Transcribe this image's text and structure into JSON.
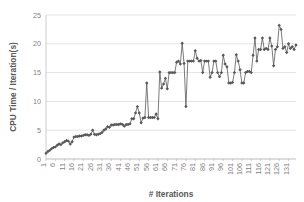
{
  "chart_data": {
    "type": "line",
    "title": "",
    "xlabel": "# Iterations",
    "ylabel": "CPU Time / Iteration(s)",
    "xlim": [
      1,
      135
    ],
    "ylim": [
      0,
      25
    ],
    "ytick_values": [
      0,
      5,
      10,
      15,
      20,
      25
    ],
    "ytick_labels": [
      "0",
      "5",
      "10",
      "15",
      "20",
      "25"
    ],
    "xtick_values": [
      1,
      6,
      11,
      16,
      21,
      26,
      31,
      36,
      41,
      46,
      51,
      56,
      61,
      66,
      71,
      76,
      81,
      86,
      91,
      96,
      101,
      106,
      111,
      116,
      121,
      126,
      131
    ],
    "xtick_labels": [
      "1",
      "6",
      "11",
      "16",
      "21",
      "26",
      "31",
      "36",
      "41",
      "46",
      "51",
      "56",
      "61",
      "66",
      "71",
      "76",
      "81",
      "86",
      "91",
      "96",
      "101",
      "106",
      "111",
      "116",
      "121",
      "126",
      "131"
    ],
    "grid": true,
    "grid_axis": "y",
    "legend": false,
    "marker": "diamond",
    "series_color": "#595959",
    "grid_color": "#D9D9D9",
    "background": "#FFFFFF",
    "x": [
      1,
      2,
      3,
      4,
      5,
      6,
      7,
      8,
      9,
      10,
      11,
      12,
      13,
      14,
      15,
      16,
      17,
      18,
      19,
      20,
      21,
      22,
      23,
      24,
      25,
      26,
      27,
      28,
      29,
      30,
      31,
      32,
      33,
      34,
      35,
      36,
      37,
      38,
      39,
      40,
      41,
      42,
      43,
      44,
      45,
      46,
      47,
      48,
      49,
      50,
      51,
      52,
      53,
      54,
      55,
      56,
      57,
      58,
      59,
      60,
      61,
      62,
      63,
      64,
      65,
      66,
      67,
      68,
      69,
      70,
      71,
      72,
      73,
      74,
      75,
      76,
      77,
      78,
      79,
      80,
      81,
      82,
      83,
      84,
      85,
      86,
      87,
      88,
      89,
      90,
      91,
      92,
      93,
      94,
      95,
      96,
      97,
      98,
      99,
      100,
      101,
      102,
      103,
      104,
      105,
      106,
      107,
      108,
      109,
      110,
      111,
      112,
      113,
      114,
      115,
      116,
      117,
      118,
      119,
      120,
      121,
      122,
      123,
      124,
      125,
      126,
      127,
      128,
      129,
      130,
      131,
      132,
      133,
      134,
      135
    ],
    "values": [
      1.0,
      1.3,
      1.5,
      1.8,
      2.0,
      2.1,
      2.4,
      2.6,
      2.5,
      2.8,
      3.0,
      3.2,
      3.1,
      2.6,
      3.0,
      3.8,
      3.9,
      3.9,
      4.0,
      4.0,
      4.1,
      4.2,
      4.2,
      4.1,
      4.3,
      5.0,
      4.3,
      4.2,
      4.3,
      4.4,
      4.6,
      5.0,
      5.2,
      5.6,
      5.5,
      5.9,
      5.9,
      6.0,
      6.0,
      6.0,
      6.1,
      6.0,
      5.7,
      6.0,
      6.0,
      6.1,
      7.0,
      7.0,
      8.0,
      9.1,
      8.0,
      6.3,
      7.1,
      7.2,
      13.2,
      7.2,
      7.2,
      7.2,
      7.2,
      7.8,
      7.0,
      15.1,
      12.3,
      13.0,
      14.0,
      12.2,
      15.0,
      15.0,
      15.0,
      15.0,
      16.8,
      17.0,
      16.5,
      20.1,
      16.6,
      9.1,
      17.0,
      17.0,
      17.0,
      17.0,
      18.8,
      17.5,
      17.0,
      17.1,
      15.0,
      17.0,
      17.0,
      17.0,
      14.2,
      15.0,
      17.0,
      17.0,
      15.0,
      14.3,
      15.0,
      18.0,
      16.5,
      16.0,
      13.2,
      13.2,
      13.3,
      15.0,
      18.1,
      17.0,
      15.5,
      13.2,
      13.2,
      15.0,
      15.2,
      15.2,
      15.0,
      18.0,
      21.0,
      17.0,
      19.0,
      19.0,
      21.0,
      19.0,
      19.2,
      19.0,
      21.0,
      19.6,
      16.2,
      19.0,
      19.5,
      23.2,
      22.5,
      19.2,
      19.5,
      18.5,
      20.0,
      19.2,
      19.5,
      19.0,
      19.8
    ]
  },
  "axes": {
    "x_axis_title": "# Iterations",
    "y_axis_title": "CPU Time / Iteration(s)"
  }
}
